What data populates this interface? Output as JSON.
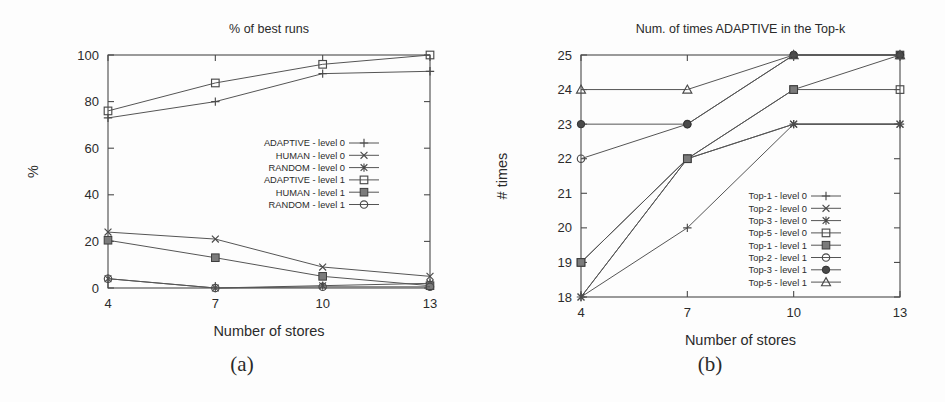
{
  "figure": {
    "caption_a": "(a)",
    "caption_b": "(b)"
  },
  "chart_data": [
    {
      "panel": "a",
      "type": "line",
      "title": "% of best runs",
      "xlabel": "Number of stores",
      "ylabel": "%",
      "x": [
        4,
        7,
        10,
        13
      ],
      "xticklabels": [
        "4",
        "7",
        "10",
        "13"
      ],
      "yticks": [
        0,
        20,
        40,
        60,
        80,
        100
      ],
      "yticklabels": [
        "0",
        "20",
        "40",
        "60",
        "80",
        "100"
      ],
      "xlim": [
        4,
        13
      ],
      "ylim": [
        0,
        100
      ],
      "grid": false,
      "legend_position": "center-right",
      "series": [
        {
          "name": "ADAPTIVE - level 0",
          "marker": "plus",
          "values": [
            73,
            80,
            92,
            93
          ]
        },
        {
          "name": "HUMAN - level 0",
          "marker": "cross",
          "values": [
            24,
            21,
            9,
            5
          ]
        },
        {
          "name": "RANDOM - level 0",
          "marker": "star",
          "values": [
            4,
            0,
            1,
            2
          ]
        },
        {
          "name": "ADAPTIVE - level 1",
          "marker": "open-square",
          "values": [
            76,
            88,
            96,
            100
          ]
        },
        {
          "name": "HUMAN - level 1",
          "marker": "filled-square",
          "values": [
            20.5,
            13,
            5,
            1
          ]
        },
        {
          "name": "RANDOM - level 1",
          "marker": "open-circle",
          "values": [
            4,
            0,
            0.5,
            0.5
          ]
        }
      ]
    },
    {
      "panel": "b",
      "type": "line",
      "title": "Num. of times ADAPTIVE in the Top-k",
      "xlabel": "Number of stores",
      "ylabel": "# times",
      "x": [
        4,
        7,
        10,
        13
      ],
      "xticklabels": [
        "4",
        "7",
        "10",
        "13"
      ],
      "yticks": [
        18,
        19,
        20,
        21,
        22,
        23,
        24,
        25
      ],
      "yticklabels": [
        "18",
        "19",
        "20",
        "21",
        "22",
        "23",
        "24",
        "25"
      ],
      "xlim": [
        4,
        13
      ],
      "ylim": [
        18,
        25
      ],
      "grid": false,
      "legend_position": "center-right",
      "series": [
        {
          "name": "Top-1 - level 0",
          "marker": "plus",
          "values": [
            18,
            20,
            23,
            23
          ]
        },
        {
          "name": "Top-2 - level 0",
          "marker": "cross",
          "values": [
            18,
            22,
            23,
            23
          ]
        },
        {
          "name": "Top-3 - level 0",
          "marker": "star",
          "values": [
            18,
            22,
            23,
            23
          ]
        },
        {
          "name": "Top-5 - level 0",
          "marker": "open-square",
          "values": [
            19,
            22,
            24,
            24
          ]
        },
        {
          "name": "Top-1 - level 1",
          "marker": "filled-square",
          "values": [
            19,
            22,
            24,
            25
          ]
        },
        {
          "name": "Top-2 - level 1",
          "marker": "open-circle",
          "values": [
            22,
            23,
            25,
            25
          ]
        },
        {
          "name": "Top-3 - level 1",
          "marker": "filled-circle",
          "values": [
            23,
            23,
            25,
            25
          ]
        },
        {
          "name": "Top-5 - level 1",
          "marker": "open-triangle",
          "values": [
            24,
            24,
            25,
            25
          ]
        }
      ]
    }
  ]
}
